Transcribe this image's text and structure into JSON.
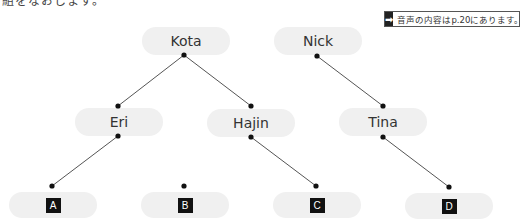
{
  "top_text": "組をなおします。",
  "note": {
    "icon": "arrow-right-icon",
    "icon_glyph": "➡",
    "text": "音声の内容はp.20にあります。"
  },
  "nodes": {
    "kota": "Kota",
    "nick": "Nick",
    "eri": "Eri",
    "hajin": "Hajin",
    "tina": "Tina",
    "a": "A",
    "b": "B",
    "c": "C",
    "d": "D"
  },
  "connections": [
    [
      "Kota",
      "Eri"
    ],
    [
      "Kota",
      "Hajin"
    ],
    [
      "Nick",
      "Tina"
    ],
    [
      "Eri",
      "A"
    ],
    [
      "Hajin",
      "C"
    ],
    [
      "Tina",
      "D"
    ]
  ],
  "colors": {
    "pill": "#f0f0f0",
    "line": "#555555",
    "dot": "#111111",
    "letter_box": "#111111"
  }
}
